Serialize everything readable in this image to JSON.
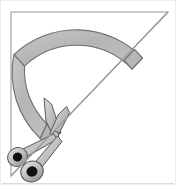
{
  "image": {
    "title": "Scissors cutting a curved paper arc on a set-square triangle",
    "width": 176,
    "height": 185,
    "background_color": "#ffffff",
    "border_color": "#e3e3e3"
  },
  "palette": {
    "paper_white": "#ffffff",
    "band_fill": "#b9b9b9",
    "band_fill_light": "#c9c9c9",
    "band_outline": "#6e6e6e",
    "triangle_outline": "#9a9a9a",
    "scissor_body": "#d0d0d0",
    "scissor_body_dark": "#a8a8a8",
    "scissor_outline": "#555555",
    "ring_hole": "#111111",
    "blade_fill": "#c4c4c4",
    "blade_shade": "#9e9e9e"
  },
  "objects": [
    {
      "id": "triangle",
      "name": "right-triangle-outline",
      "label": "Right triangle (set square) outline",
      "vertices": [
        [
          11,
          12
        ],
        [
          168,
          12
        ],
        [
          11,
          176
        ]
      ],
      "stroke": "#9a9a9a",
      "stroke_width": 1.1,
      "fill": "none"
    },
    {
      "id": "arc-band",
      "name": "curved-arc-band",
      "label": "Curved gray arc band sweeping from lower-left to upper-right",
      "center": [
        44,
        126
      ],
      "inner_radius": 76,
      "outer_radius": 91,
      "start_angle_deg": 186,
      "end_angle_deg": 310,
      "fill": "#b9b9b9",
      "stroke": "#6e6e6e"
    },
    {
      "id": "arc-end-cap",
      "name": "arc-end-cap",
      "label": "Angled cut end of arc band at upper right",
      "position": [
        136,
        51
      ]
    },
    {
      "id": "scissors",
      "name": "scissors",
      "label": "Open pair of scissors cutting the band",
      "pivot": [
        55,
        133
      ],
      "blade_tip_upper": [
        46,
        100
      ],
      "blade_tip_lower": [
        63,
        108
      ],
      "rings": [
        {
          "name": "scissor-ring-left",
          "center": [
            17,
            157
          ],
          "outer_rx": 10,
          "outer_ry": 9,
          "hole_rx": 4.6,
          "hole_ry": 4.4
        },
        {
          "name": "scissor-ring-right",
          "center": [
            32,
            172
          ],
          "outer_rx": 11,
          "outer_ry": 10,
          "hole_rx": 5.4,
          "hole_ry": 5.2
        }
      ]
    }
  ]
}
